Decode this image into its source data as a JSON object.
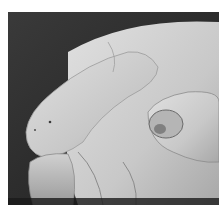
{
  "image": {
    "subject": "close-up photograph of a hand showing fingertips and thumbnail",
    "style": "grayscale",
    "colors": {
      "background": "#2a2a2a",
      "skin_light": "#d8d8d8",
      "skin_mid": "#bdbdbd",
      "skin_shadow": "#8a8a8a",
      "border": "#ffffff"
    }
  }
}
